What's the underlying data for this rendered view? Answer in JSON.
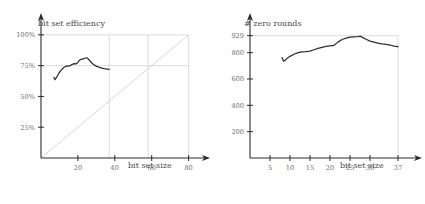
{
  "figure": {
    "panel_count": 2,
    "background": "#ffffff",
    "curve_color": "#2e2e2e",
    "grid_color": "#cfcfcf",
    "axis_color": "#2b2b2b",
    "label_color": "#6d6d6d"
  },
  "chart_data": [
    {
      "id": "bit-set-efficiency",
      "type": "line",
      "title": "",
      "xlabel": "bit set size",
      "ylabel": "bit set efficiency",
      "xlim": [
        0,
        84
      ],
      "ylim": [
        0,
        108
      ],
      "xticks": [
        20,
        40,
        60,
        80
      ],
      "xticklabels": [
        "20",
        "40",
        "60",
        "80"
      ],
      "yticks": [
        25,
        50,
        75,
        100
      ],
      "yticklabels": [
        "25%",
        "50%",
        "75%",
        "100%"
      ],
      "grid": true,
      "gridlines": {
        "horizontal": [
          75,
          100
        ],
        "vertical": [
          37,
          58,
          80
        ]
      },
      "reference_line": {
        "label": "diagonal y=x scaled",
        "from": [
          0,
          0
        ],
        "to": [
          80,
          100
        ]
      },
      "legend": "none",
      "series": [
        {
          "name": "bit set efficiency",
          "x": [
            7.0,
            7.6,
            8.2,
            9.0,
            10.0,
            11.0,
            12.0,
            13.0,
            14.0,
            15.0,
            16.0,
            17.0,
            18.0,
            19.0,
            20.0,
            21.0,
            22.0,
            23.0,
            24.0,
            25.0,
            26.0,
            27.0,
            28.0,
            29.0,
            30.0,
            31.0,
            32.0,
            33.0,
            34.0,
            35.0,
            36.0,
            37.0
          ],
          "y": [
            65.5,
            63.5,
            65.0,
            67.0,
            69.5,
            71.5,
            73.0,
            74.2,
            74.6,
            74.6,
            75.2,
            76.0,
            76.6,
            76.4,
            77.6,
            79.6,
            80.3,
            80.4,
            81.2,
            81.3,
            79.8,
            78.0,
            76.5,
            75.4,
            74.6,
            74.0,
            73.4,
            73.0,
            72.6,
            72.4,
            72.2,
            72.0
          ]
        }
      ]
    },
    {
      "id": "zero-rounds",
      "type": "line",
      "title": "",
      "xlabel": "bit set size",
      "ylabel": "# zero rounds",
      "xlim": [
        0,
        39.5
      ],
      "ylim": [
        0,
        1010
      ],
      "xticks": [
        5,
        10,
        15,
        20,
        25,
        30,
        37
      ],
      "xticklabels": [
        "5",
        "10",
        "15",
        "20",
        "25",
        "30",
        "37"
      ],
      "yticks": [
        200,
        400,
        600,
        800,
        929
      ],
      "yticklabels": [
        "200",
        "400",
        "600",
        "800",
        "929"
      ],
      "grid": true,
      "gridlines": {
        "horizontal": [
          929
        ],
        "vertical": [
          37
        ]
      },
      "legend": "none",
      "series": [
        {
          "name": "# zero rounds",
          "x": [
            8.0,
            8.4,
            8.8,
            9.4,
            10.0,
            11.0,
            12.0,
            13.0,
            14.0,
            15.0,
            16.0,
            17.0,
            18.0,
            19.0,
            20.0,
            21.0,
            22.0,
            23.0,
            24.0,
            25.0,
            26.0,
            27.0,
            27.6,
            28.0,
            29.0,
            30.0,
            31.0,
            32.0,
            33.0,
            34.0,
            35.0,
            36.0,
            37.0
          ],
          "y": [
            763,
            735,
            742,
            760,
            772,
            788,
            800,
            806,
            808,
            812,
            822,
            832,
            840,
            848,
            852,
            856,
            880,
            900,
            910,
            918,
            920,
            922,
            925,
            918,
            902,
            888,
            880,
            872,
            866,
            862,
            858,
            850,
            845
          ]
        }
      ]
    }
  ]
}
